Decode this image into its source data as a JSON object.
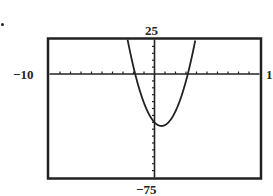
{
  "chart_data": {
    "type": "line",
    "title": "",
    "xlabel": "",
    "ylabel": "",
    "xlim": [
      -10,
      10
    ],
    "ylim": [
      -75,
      25
    ],
    "window_labels": {
      "xmin": "−10",
      "xmax": "1",
      "ymin": "−75",
      "ymax": "25"
    },
    "x_tick_step": 1,
    "y_tick_step": 5,
    "grid": false,
    "legend": null,
    "series": [
      {
        "name": "parabola",
        "description": "Upward-opening parabola, approx y = 6x^2 - 8x - 35",
        "x": [
          -2.57,
          -2,
          -1.83,
          -1,
          0,
          0.67,
          1,
          2,
          3,
          3.24,
          3.9
        ],
        "y": [
          25,
          5,
          0,
          -21,
          -35,
          -37.7,
          -37,
          -27,
          -5,
          0,
          25
        ]
      }
    ],
    "annotations": {
      "vertex": [
        0.67,
        -37.7
      ],
      "x_intercepts": [
        -1.83,
        3.24
      ],
      "y_intercept": -35
    }
  },
  "colors": {
    "frame": "#222222",
    "curve": "#222222",
    "background": "#ffffff"
  }
}
